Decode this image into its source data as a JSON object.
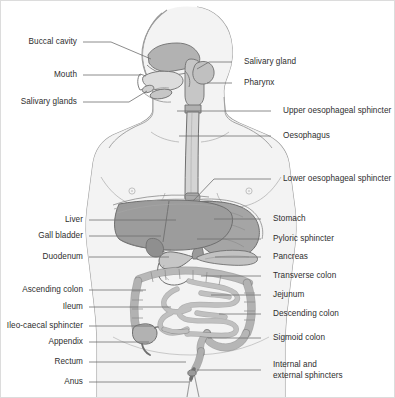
{
  "figure": {
    "width": 395,
    "height": 398,
    "background_color": "#ffffff",
    "border_color": "#dcdcdc",
    "line_color": "#6f6f6f",
    "text_color": "#2e2e2e",
    "body_fill": "#f1f1f1",
    "body_stroke": "#9a9a9a",
    "organ_fill_light": "#d2d2d2",
    "organ_fill_mid": "#b6b6b6",
    "organ_fill_dark": "#9c9c9c",
    "organ_stroke": "#6f6f6f"
  },
  "labels": {
    "left": [
      {
        "id": "buccal-cavity",
        "text": "Buccal cavity",
        "x": 78,
        "y": 41,
        "leader": [
          [
            82,
            41
          ],
          [
            110,
            41
          ],
          [
            150,
            58
          ]
        ]
      },
      {
        "id": "mouth",
        "text": "Mouth",
        "x": 78,
        "y": 74,
        "leader": [
          [
            82,
            74
          ],
          [
            140,
            74
          ]
        ]
      },
      {
        "id": "salivary-glands",
        "text": "Salivary glands",
        "x": 78,
        "y": 101,
        "leader": [
          [
            82,
            101
          ],
          [
            128,
            101
          ],
          [
            146,
            90
          ]
        ]
      },
      {
        "id": "liver",
        "text": "Liver",
        "x": 84,
        "y": 219,
        "leader": [
          [
            88,
            219
          ],
          [
            175,
            219
          ]
        ]
      },
      {
        "id": "gall-bladder",
        "text": "Gall bladder",
        "x": 84,
        "y": 235,
        "leader": [
          [
            88,
            235
          ],
          [
            160,
            235
          ]
        ]
      },
      {
        "id": "duodenum",
        "text": "Duodenum",
        "x": 84,
        "y": 256,
        "leader": [
          [
            88,
            256
          ],
          [
            168,
            256
          ]
        ]
      },
      {
        "id": "ascending-colon",
        "text": "Ascending colon",
        "x": 84,
        "y": 289,
        "leader": [
          [
            88,
            289
          ],
          [
            145,
            289
          ]
        ]
      },
      {
        "id": "ileum",
        "text": "Ileum",
        "x": 84,
        "y": 306,
        "leader": [
          [
            88,
            306
          ],
          [
            170,
            306
          ]
        ]
      },
      {
        "id": "ileo-caecal-sphincter",
        "text": "Ileo-caecal sphincter",
        "x": 84,
        "y": 325,
        "leader": [
          [
            88,
            325
          ],
          [
            152,
            325
          ]
        ]
      },
      {
        "id": "appendix",
        "text": "Appendix",
        "x": 84,
        "y": 341,
        "leader": [
          [
            88,
            341
          ],
          [
            148,
            341
          ]
        ]
      },
      {
        "id": "rectum",
        "text": "Rectum",
        "x": 84,
        "y": 361,
        "leader": [
          [
            88,
            361
          ],
          [
            185,
            361
          ]
        ]
      },
      {
        "id": "anus",
        "text": "Anus",
        "x": 84,
        "y": 381,
        "leader": [
          [
            88,
            381
          ],
          [
            188,
            381
          ]
        ]
      }
    ],
    "right": [
      {
        "id": "salivary-gland",
        "text": "Salivary gland",
        "x": 243,
        "y": 61,
        "leader": [
          [
            231,
            61
          ],
          [
            208,
            61
          ],
          [
            196,
            68
          ]
        ]
      },
      {
        "id": "pharynx",
        "text": "Pharynx",
        "x": 243,
        "y": 82,
        "leader": [
          [
            231,
            82
          ],
          [
            206,
            82
          ]
        ]
      },
      {
        "id": "upper-oesophageal-sphincter",
        "text": "Upper oesophageal sphincter",
        "x": 282,
        "y": 110,
        "leader": [
          [
            270,
            110
          ],
          [
            176,
            110
          ]
        ]
      },
      {
        "id": "oesophagus",
        "text": "Oesophagus",
        "x": 282,
        "y": 135,
        "leader": [
          [
            270,
            135
          ],
          [
            178,
            135
          ]
        ]
      },
      {
        "id": "lower-oesophageal-sphincter",
        "text": "Lower oesophageal sphincter",
        "x": 282,
        "y": 178,
        "leader": [
          [
            270,
            178
          ],
          [
            213,
            178
          ],
          [
            192,
            200
          ]
        ]
      },
      {
        "id": "stomach",
        "text": "Stomach",
        "x": 272,
        "y": 218,
        "leader": [
          [
            260,
            218
          ],
          [
            213,
            218
          ]
        ]
      },
      {
        "id": "pyloric-sphincter",
        "text": "Pyloric sphincter",
        "x": 272,
        "y": 238,
        "leader": [
          [
            260,
            238
          ],
          [
            196,
            238
          ]
        ]
      },
      {
        "id": "pancreas",
        "text": "Pancreas",
        "x": 272,
        "y": 256,
        "leader": [
          [
            260,
            256
          ],
          [
            214,
            256
          ]
        ]
      },
      {
        "id": "transverse-colon",
        "text": "Transverse colon",
        "x": 272,
        "y": 275,
        "leader": [
          [
            260,
            275
          ],
          [
            200,
            275
          ]
        ]
      },
      {
        "id": "jejunum",
        "text": "Jejunum",
        "x": 272,
        "y": 294,
        "leader": [
          [
            260,
            294
          ],
          [
            210,
            294
          ]
        ]
      },
      {
        "id": "descending-colon",
        "text": "Descending colon",
        "x": 272,
        "y": 313,
        "leader": [
          [
            260,
            313
          ],
          [
            218,
            313
          ]
        ]
      },
      {
        "id": "sigmoid-colon",
        "text": "Sigmoid colon",
        "x": 272,
        "y": 337,
        "leader": [
          [
            260,
            337
          ],
          [
            207,
            337
          ]
        ]
      },
      {
        "id": "internal-and-external-sphincters",
        "text": "Internal and\nexternal sphincters",
        "x": 272,
        "y": 369,
        "leader": [
          [
            260,
            369
          ],
          [
            196,
            369
          ]
        ]
      }
    ]
  }
}
